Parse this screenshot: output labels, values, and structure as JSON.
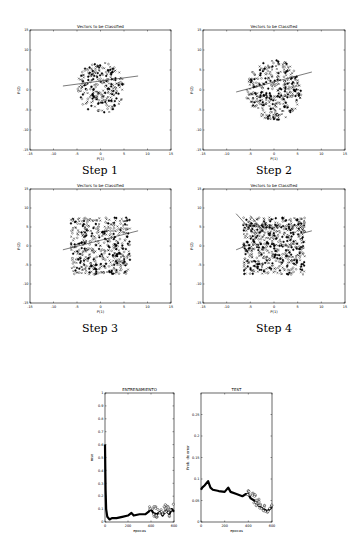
{
  "chart_data": [
    {
      "type": "scatter",
      "title": "Vectors to be Classified",
      "caption": "Step 1",
      "xlabel": "P(1)",
      "ylabel": "P(2)",
      "xlim": [
        -15,
        15
      ],
      "ylim": [
        -15,
        15
      ],
      "xticks": [
        "-15",
        "-10",
        "-5",
        "0",
        "5",
        "10",
        "15"
      ],
      "yticks": [
        "15",
        "10",
        "5",
        "0",
        "-5",
        "-10",
        "-15"
      ],
      "grid": false,
      "point_cloud": {
        "cx": 0,
        "cy": 0.5,
        "rx": 5,
        "ry": 6.5,
        "n": 260
      },
      "decision_lines": [
        [
          [
            -8,
            1
          ],
          [
            8,
            3.5
          ]
        ]
      ]
    },
    {
      "type": "scatter",
      "title": "Vectors to be Classified",
      "caption": "Step 2",
      "xlabel": "P(1)",
      "ylabel": "P(2)",
      "xlim": [
        -15,
        15
      ],
      "ylim": [
        -15,
        15
      ],
      "xticks": [
        "-15",
        "-10",
        "-5",
        "0",
        "5",
        "10",
        "15"
      ],
      "yticks": [
        "15",
        "10",
        "5",
        "0",
        "-5",
        "-10",
        "-15"
      ],
      "grid": false,
      "point_cloud": {
        "cx": 0,
        "cy": 0,
        "rx": 6,
        "ry": 7.5,
        "n": 380
      },
      "decision_lines": [
        [
          [
            -8,
            -0.5
          ],
          [
            8,
            4.5
          ]
        ]
      ]
    },
    {
      "type": "scatter",
      "title": "Vectors to be Classified",
      "caption": "Step 3",
      "xlabel": "P(1)",
      "ylabel": "P(2)",
      "xlim": [
        -15,
        15
      ],
      "ylim": [
        -15,
        15
      ],
      "xticks": [
        "-15",
        "-10",
        "-5",
        "0",
        "5",
        "10",
        "15"
      ],
      "yticks": [
        "15",
        "10",
        "5",
        "0",
        "-5",
        "-10",
        "-15"
      ],
      "grid": false,
      "point_cloud": {
        "cx": 0,
        "cy": 0,
        "rx": 6.3,
        "ry": 7.5,
        "n": 480
      },
      "decision_lines": [
        [
          [
            -8,
            -1
          ],
          [
            8,
            4
          ]
        ]
      ]
    },
    {
      "type": "scatter",
      "title": "Vectors to be Classified",
      "caption": "Step 4",
      "xlabel": "P(1)",
      "ylabel": "P(2)",
      "xlim": [
        -15,
        15
      ],
      "ylim": [
        -15,
        15
      ],
      "xticks": [
        "-15",
        "-10",
        "-5",
        "0",
        "5",
        "10",
        "15"
      ],
      "yticks": [
        "15",
        "10",
        "5",
        "0",
        "-5",
        "-10",
        "-15"
      ],
      "grid": false,
      "point_cloud": {
        "cx": 0,
        "cy": 0,
        "rx": 6.5,
        "ry": 7.5,
        "n": 600
      },
      "decision_lines": [
        [
          [
            -8,
            -1
          ],
          [
            -5,
            0.5
          ]
        ],
        [
          [
            -8,
            8.5
          ],
          [
            -4,
            3
          ]
        ],
        [
          [
            -5,
            8
          ],
          [
            -2,
            3.5
          ]
        ],
        [
          [
            5,
            3
          ],
          [
            8,
            4
          ]
        ]
      ]
    },
    {
      "type": "line",
      "title": "ENTRENAMIENTO",
      "xlabel": "epocas",
      "ylabel": "mse",
      "xlim": [
        0,
        600
      ],
      "ylim": [
        0,
        1
      ],
      "xticks": [
        "0",
        "200",
        "400",
        "600"
      ],
      "yticks": [
        "0",
        "0.1",
        "0.2",
        "0.3",
        "0.4",
        "0.5",
        "0.6",
        "0.7",
        "0.8",
        "0.9",
        "1"
      ],
      "grid": false,
      "x": [
        0,
        5,
        10,
        20,
        40,
        60,
        80,
        100,
        150,
        200,
        230,
        250,
        300,
        350,
        380,
        400,
        420,
        450,
        480,
        500,
        530,
        560,
        580,
        600
      ],
      "values": [
        0.6,
        0.25,
        0.1,
        0.04,
        0.02,
        0.03,
        0.03,
        0.03,
        0.04,
        0.05,
        0.07,
        0.05,
        0.06,
        0.06,
        0.08,
        0.1,
        0.07,
        0.06,
        0.08,
        0.05,
        0.09,
        0.06,
        0.1,
        0.08
      ]
    },
    {
      "type": "line",
      "title": "TEST",
      "xlabel": "epocas",
      "ylabel": "Prob. de error",
      "xlim": [
        0,
        600
      ],
      "ylim": [
        0,
        0.3
      ],
      "xticks": [
        "0",
        "200",
        "400",
        "600"
      ],
      "yticks": [
        "0",
        "0.05",
        "0.1",
        "0.15",
        "0.2",
        "0.25"
      ],
      "grid": false,
      "x": [
        0,
        10,
        30,
        60,
        80,
        100,
        150,
        200,
        230,
        250,
        300,
        350,
        380,
        400,
        420,
        450,
        480,
        500,
        530,
        560,
        580,
        600
      ],
      "values": [
        0.075,
        0.08,
        0.085,
        0.095,
        0.08,
        0.075,
        0.072,
        0.07,
        0.08,
        0.07,
        0.065,
        0.06,
        0.065,
        0.065,
        0.055,
        0.05,
        0.04,
        0.035,
        0.03,
        0.025,
        0.03,
        0.035
      ]
    }
  ]
}
